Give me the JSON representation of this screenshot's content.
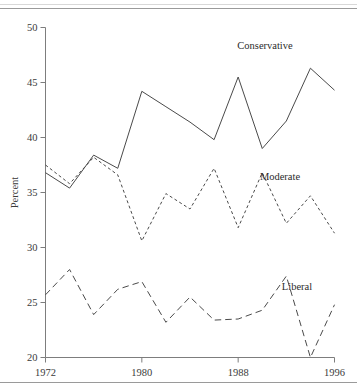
{
  "figure": {
    "top_rule": true,
    "bottom_rule": true
  },
  "chart_data": {
    "type": "line",
    "title": "",
    "xlabel": "",
    "ylabel": "Percent",
    "xlim": [
      1972,
      1996
    ],
    "ylim": [
      20,
      50
    ],
    "grid": false,
    "legend_position": "inline-right",
    "x": [
      1972,
      1974,
      1976,
      1978,
      1980,
      1982,
      1984,
      1986,
      1988,
      1990,
      1992,
      1994,
      1996
    ],
    "xticks": [
      1972,
      1980,
      1988,
      1996
    ],
    "xticklabels": [
      "1972",
      "1980",
      "1988",
      "1996"
    ],
    "yticks": [
      20,
      25,
      30,
      35,
      40,
      45,
      50
    ],
    "yticklabels": [
      "20",
      "25",
      "30",
      "35",
      "40",
      "45",
      "50"
    ],
    "series": [
      {
        "name": "Conservative",
        "linestyle": "solid",
        "color": "#4a4a4a",
        "values": [
          36.8,
          35.4,
          38.4,
          37.2,
          44.2,
          42.8,
          41.4,
          39.8,
          45.5,
          39.0,
          41.5,
          46.3,
          44.3
        ]
      },
      {
        "name": "Moderate",
        "linestyle": "short-dash",
        "color": "#4a4a4a",
        "values": [
          37.5,
          35.8,
          38.2,
          36.6,
          30.6,
          34.9,
          33.5,
          37.2,
          31.8,
          36.8,
          32.2,
          34.7,
          31.3
        ]
      },
      {
        "name": "Liberal",
        "linestyle": "long-dash",
        "color": "#4a4a4a",
        "values": [
          25.7,
          28.0,
          23.9,
          26.2,
          26.9,
          23.2,
          25.5,
          23.4,
          23.5,
          24.3,
          27.4,
          20.0,
          24.8
        ]
      }
    ],
    "annotations": [
      {
        "text": "Conservative",
        "x_px": 265,
        "y_px": 49
      },
      {
        "text": "Moderate",
        "x_px": 280,
        "y_px": 180
      },
      {
        "text": "Liberal",
        "x_px": 297,
        "y_px": 290
      }
    ]
  }
}
